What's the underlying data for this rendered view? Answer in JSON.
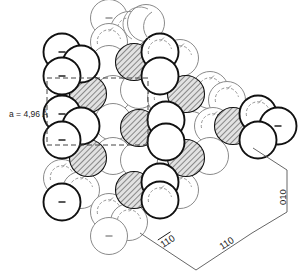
{
  "figure": {
    "title_text": "",
    "lattice_label": "a = 4,96 Å",
    "axis_labels": {
      "left_diagonal": "110",
      "left_diagonal_has_overbar": true,
      "right_diagonal": "110",
      "vertical": "010"
    },
    "colors": {
      "outline_dark": "#111111",
      "outline_light": "#8a8a8a",
      "hatch_stroke": "#3c3c3c",
      "hatch_fill": "#d9d9d9",
      "fill_white": "#ffffff",
      "dashed_cell": "#444444",
      "leader_line": "#555555",
      "text": "#1a1a1a"
    },
    "geometry": {
      "circle_radius": 18.5,
      "unit_cell_rect": {
        "x": 47,
        "y": 78,
        "width": 101,
        "height": 67
      }
    },
    "legend_notes": {
      "dark_circle_marker": "–",
      "light_circle_marker": "arc"
    }
  },
  "atoms": [
    {
      "cx": 109,
      "cy": 18,
      "kind": "light",
      "mark": "dash"
    },
    {
      "cx": 129,
      "cy": 30,
      "kind": "light",
      "mark": "arc"
    },
    {
      "cx": 109,
      "cy": 42,
      "kind": "light",
      "mark": "arc"
    },
    {
      "cx": 146,
      "cy": 23,
      "kind": "light",
      "mark": "arcbig"
    },
    {
      "cx": 62,
      "cy": 52,
      "kind": "dark",
      "mark": "dash"
    },
    {
      "cx": 81,
      "cy": 64,
      "kind": "dark",
      "mark": "none"
    },
    {
      "cx": 62,
      "cy": 76,
      "kind": "dark",
      "mark": "dash"
    },
    {
      "cx": 109,
      "cy": 64,
      "kind": "light",
      "mark": "none"
    },
    {
      "cx": 134,
      "cy": 62,
      "kind": "hatch",
      "mark": "none"
    },
    {
      "cx": 160,
      "cy": 52,
      "kind": "dark",
      "mark": "arc"
    },
    {
      "cx": 180,
      "cy": 58,
      "kind": "light",
      "mark": "arc"
    },
    {
      "cx": 160,
      "cy": 76,
      "kind": "dark",
      "mark": "none"
    },
    {
      "cx": 88,
      "cy": 94,
      "kind": "hatch",
      "mark": "none"
    },
    {
      "cx": 113,
      "cy": 94,
      "kind": "light",
      "mark": "none"
    },
    {
      "cx": 139,
      "cy": 90,
      "kind": "light",
      "mark": "none"
    },
    {
      "cx": 166,
      "cy": 98,
      "kind": "light",
      "mark": "arc"
    },
    {
      "cx": 186,
      "cy": 94,
      "kind": "hatch",
      "mark": "none"
    },
    {
      "cx": 210,
      "cy": 90,
      "kind": "light",
      "mark": "arc"
    },
    {
      "cx": 227,
      "cy": 100,
      "kind": "light",
      "mark": "arc"
    },
    {
      "cx": 62,
      "cy": 114,
      "kind": "dark",
      "mark": "dash"
    },
    {
      "cx": 81,
      "cy": 126,
      "kind": "dark",
      "mark": "none"
    },
    {
      "cx": 62,
      "cy": 140,
      "kind": "dark",
      "mark": "dash"
    },
    {
      "cx": 113,
      "cy": 122,
      "kind": "light",
      "mark": "none"
    },
    {
      "cx": 139,
      "cy": 128,
      "kind": "hatch",
      "mark": "none"
    },
    {
      "cx": 166,
      "cy": 120,
      "kind": "dark",
      "mark": "none"
    },
    {
      "cx": 166,
      "cy": 142,
      "kind": "dark",
      "mark": "none"
    },
    {
      "cx": 191,
      "cy": 130,
      "kind": "light",
      "mark": "none"
    },
    {
      "cx": 213,
      "cy": 126,
      "kind": "light",
      "mark": "arc"
    },
    {
      "cx": 233,
      "cy": 126,
      "kind": "hatch",
      "mark": "none"
    },
    {
      "cx": 258,
      "cy": 114,
      "kind": "dark",
      "mark": "arc"
    },
    {
      "cx": 278,
      "cy": 126,
      "kind": "dark",
      "mark": "dash"
    },
    {
      "cx": 258,
      "cy": 140,
      "kind": "dark",
      "mark": "none"
    },
    {
      "cx": 88,
      "cy": 158,
      "kind": "hatch",
      "mark": "none"
    },
    {
      "cx": 113,
      "cy": 156,
      "kind": "light",
      "mark": "none"
    },
    {
      "cx": 139,
      "cy": 160,
      "kind": "light",
      "mark": "none"
    },
    {
      "cx": 186,
      "cy": 158,
      "kind": "hatch",
      "mark": "none"
    },
    {
      "cx": 210,
      "cy": 156,
      "kind": "light",
      "mark": "none"
    },
    {
      "cx": 62,
      "cy": 178,
      "kind": "light",
      "mark": "arc"
    },
    {
      "cx": 81,
      "cy": 190,
      "kind": "light",
      "mark": "arc"
    },
    {
      "cx": 62,
      "cy": 202,
      "kind": "dark",
      "mark": "dash"
    },
    {
      "cx": 134,
      "cy": 190,
      "kind": "hatch",
      "mark": "none"
    },
    {
      "cx": 160,
      "cy": 182,
      "kind": "dark",
      "mark": "none"
    },
    {
      "cx": 180,
      "cy": 190,
      "kind": "light",
      "mark": "arc"
    },
    {
      "cx": 160,
      "cy": 200,
      "kind": "dark",
      "mark": "arc"
    },
    {
      "cx": 109,
      "cy": 212,
      "kind": "light",
      "mark": "arc"
    },
    {
      "cx": 129,
      "cy": 222,
      "kind": "light",
      "mark": "arc"
    },
    {
      "cx": 109,
      "cy": 236,
      "kind": "light",
      "mark": "dash"
    }
  ]
}
